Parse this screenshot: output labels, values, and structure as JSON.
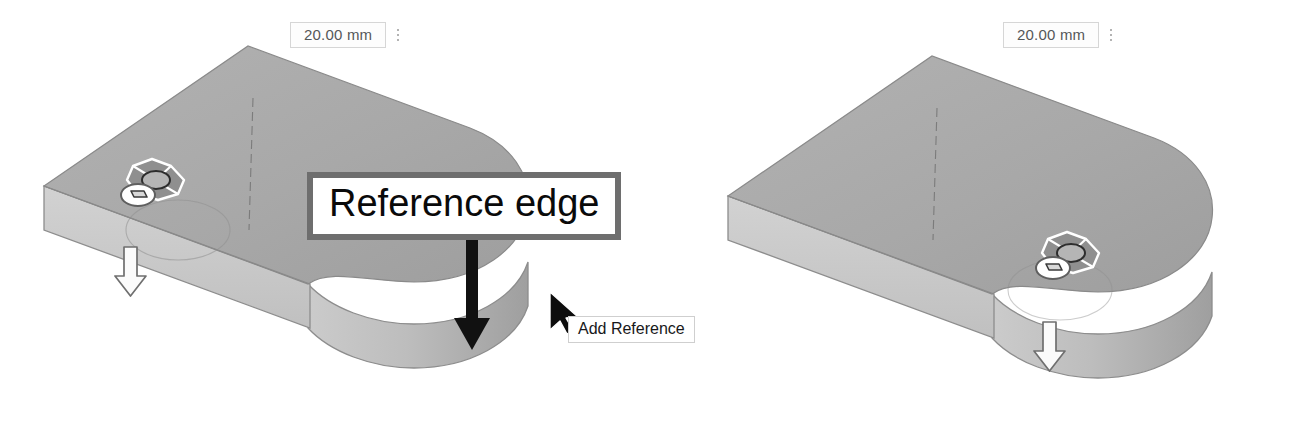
{
  "scene": {
    "title": "CAD part extrude interaction",
    "background_color": "#ffffff",
    "colors": {
      "top_face": "#a7a7a7",
      "top_face_light": "#b0b0b0",
      "side_face": "#c9c9c9",
      "curved_face": "#b9b9b9",
      "curved_face_dark": "#a2a2a2",
      "edge_line": "#7c7c7c",
      "sketch_line": "#6d6d6d",
      "callout_border": "#6e6e6e",
      "callout_fill": "#ffffff",
      "arrow_black": "#111111",
      "handle_fill": "#ffffff",
      "handle_stroke": "#6f6f6f",
      "chip_text": "#555759",
      "chip_border": "#d6d6d6",
      "tooltip_border": "#cfcfcf"
    }
  },
  "views": [
    {
      "id": "left-view",
      "name": "before-reference-added",
      "dimension": {
        "value": "20.00 mm",
        "menu_icon": "kebab-menu-icon"
      },
      "manipulator": {
        "name": "move-manipulator-widget",
        "sub_icon": "face-select-icon"
      },
      "extrude_handle": {
        "name": "extrude-down-arrow-handle",
        "icon": "arrow-down-icon"
      },
      "callout": {
        "text": "Reference edge",
        "arrow": "arrow-down-icon"
      },
      "tooltip": {
        "text": "Add Reference"
      },
      "cursor": {
        "name": "mouse-cursor",
        "icon": "cursor-arrow-icon"
      }
    },
    {
      "id": "right-view",
      "name": "after-reference-added",
      "dimension": {
        "value": "20.00 mm",
        "menu_icon": "kebab-menu-icon"
      },
      "manipulator": {
        "name": "move-manipulator-widget",
        "sub_icon": "face-select-icon"
      },
      "extrude_handle": {
        "name": "extrude-down-arrow-handle",
        "icon": "arrow-down-icon"
      }
    }
  ]
}
